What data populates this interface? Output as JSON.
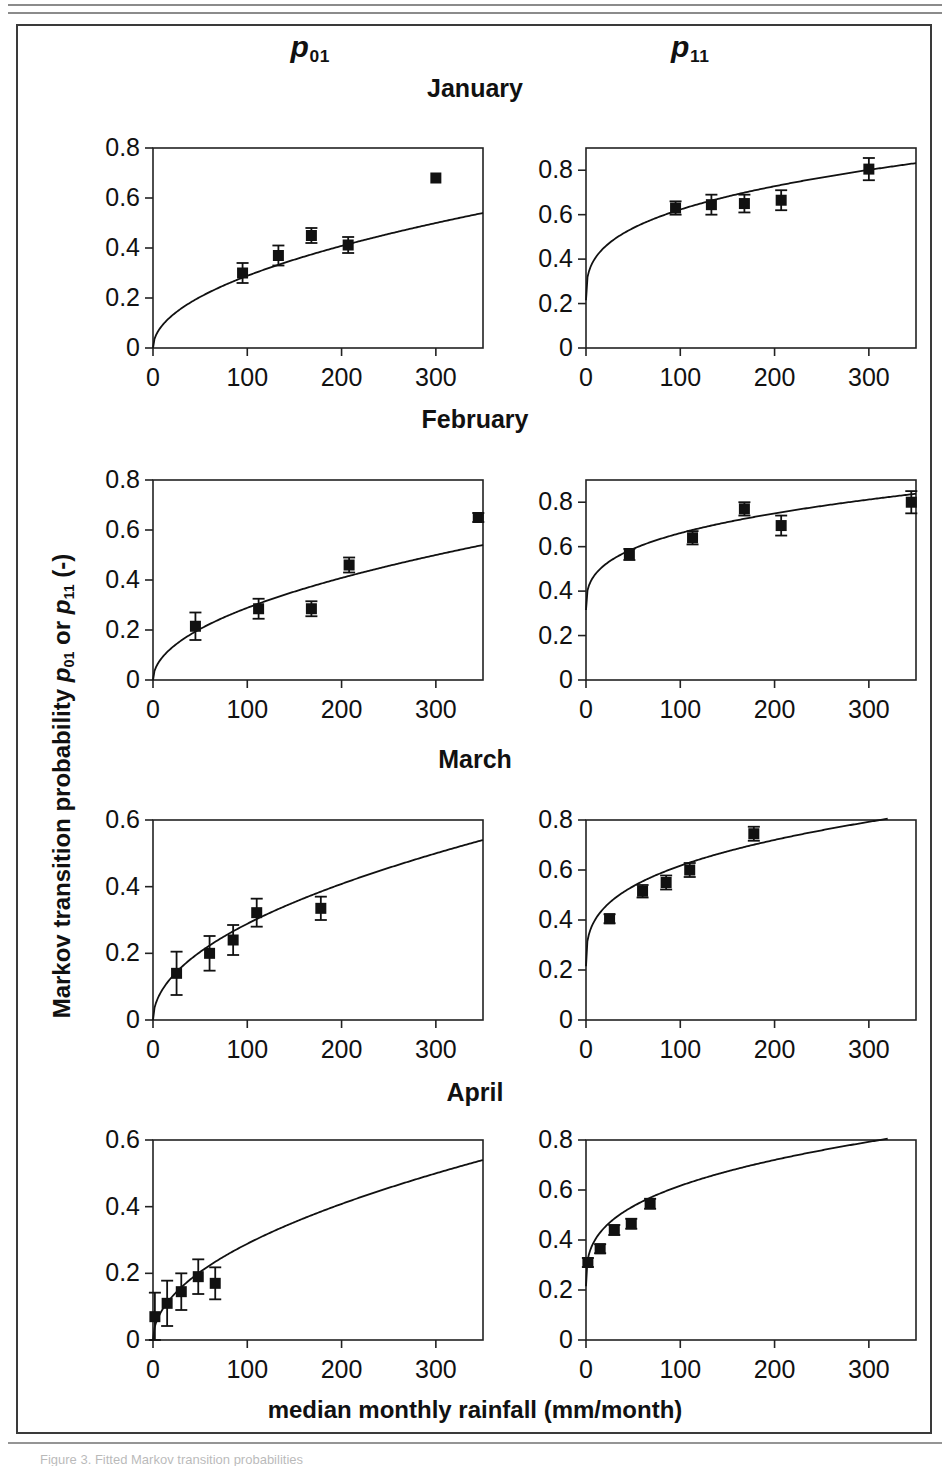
{
  "figure": {
    "column_headers": [
      {
        "name": "p01",
        "symbol": "p",
        "subscript": "01"
      },
      {
        "name": "p11",
        "symbol": "p",
        "subscript": "11"
      }
    ],
    "y_axis_title": {
      "prefix": "Markov transition probability ",
      "sym1": "p",
      "sub1": "01",
      "middle": " or ",
      "sym2": "p",
      "sub2": "11",
      "suffix": " (-)"
    },
    "x_axis_title": "median monthly rainfall (mm/month)",
    "month_titles": [
      "January",
      "February",
      "March",
      "April"
    ],
    "caption_partial": "Figure 3. Fitted Markov transition probabilities"
  },
  "chart_data": [
    {
      "id": "january-p01",
      "type": "scatter",
      "title": "January",
      "series_name": "p01",
      "xlabel": "median monthly rainfall (mm/month)",
      "ylabel": "Markov transition probability p01 or p11 (-)",
      "xlim": [
        0,
        350
      ],
      "ylim": [
        0,
        0.8
      ],
      "xticks": [
        0,
        100,
        200,
        300
      ],
      "yticks": [
        0,
        0.2,
        0.4,
        0.6,
        0.8
      ],
      "ytick_labels": [
        "0",
        "0.2",
        "0.4",
        "0.6",
        "0.8"
      ],
      "grid": false,
      "legend": "none",
      "points": [
        {
          "x": 95,
          "y": 0.3,
          "yerr": 0.04
        },
        {
          "x": 133,
          "y": 0.37,
          "yerr": 0.04
        },
        {
          "x": 168,
          "y": 0.45,
          "yerr": 0.03
        },
        {
          "x": 207,
          "y": 0.412,
          "yerr": 0.032
        },
        {
          "x": 300,
          "y": 0.68,
          "yerr": 0.0
        }
      ],
      "fit_curve": {
        "form": "a*x^b",
        "a": 0.0305,
        "b": 0.4938,
        "x_start": 0,
        "x_end": 350,
        "y_at_350": 0.54
      }
    },
    {
      "id": "january-p11",
      "type": "scatter",
      "title": "January",
      "series_name": "p11",
      "xlim": [
        0,
        350
      ],
      "ylim": [
        0,
        0.9
      ],
      "xticks": [
        0,
        100,
        200,
        300
      ],
      "yticks": [
        0,
        0.2,
        0.4,
        0.6,
        0.8
      ],
      "ytick_labels": [
        "0",
        "0.2",
        "0.4",
        "0.6",
        "0.8"
      ],
      "grid": false,
      "legend": "none",
      "points": [
        {
          "x": 95,
          "y": 0.63,
          "yerr": 0.03
        },
        {
          "x": 133,
          "y": 0.645,
          "yerr": 0.045
        },
        {
          "x": 168,
          "y": 0.65,
          "yerr": 0.04
        },
        {
          "x": 207,
          "y": 0.665,
          "yerr": 0.045
        },
        {
          "x": 300,
          "y": 0.805,
          "yerr": 0.05
        }
      ],
      "fit_curve": {
        "form": "a*x^b + c",
        "y_at_0": 0.215,
        "y_at_100": 0.635,
        "y_at_350": 0.832
      }
    },
    {
      "id": "february-p01",
      "type": "scatter",
      "title": "February",
      "series_name": "p01",
      "xlim": [
        0,
        350
      ],
      "ylim": [
        0,
        0.8
      ],
      "xticks": [
        0,
        100,
        200,
        300
      ],
      "yticks": [
        0,
        0.2,
        0.4,
        0.6,
        0.8
      ],
      "ytick_labels": [
        "0",
        "0.2",
        "0.4",
        "0.6",
        "0.8"
      ],
      "grid": false,
      "legend": "none",
      "points": [
        {
          "x": 45,
          "y": 0.215,
          "yerr": 0.055
        },
        {
          "x": 112,
          "y": 0.285,
          "yerr": 0.04
        },
        {
          "x": 168,
          "y": 0.285,
          "yerr": 0.03
        },
        {
          "x": 208,
          "y": 0.46,
          "yerr": 0.03
        },
        {
          "x": 345,
          "y": 0.65,
          "yerr": 0.018
        }
      ],
      "fit_curve": {
        "form": "a*x^b",
        "y_at_0": 0.0,
        "y_at_350": 0.54
      }
    },
    {
      "id": "february-p11",
      "type": "scatter",
      "title": "February",
      "series_name": "p11",
      "xlim": [
        0,
        350
      ],
      "ylim": [
        0,
        0.9
      ],
      "xticks": [
        0,
        100,
        200,
        300
      ],
      "yticks": [
        0,
        0.2,
        0.4,
        0.6,
        0.8
      ],
      "ytick_labels": [
        "0",
        "0.2",
        "0.4",
        "0.6",
        "0.8"
      ],
      "grid": false,
      "legend": "none",
      "points": [
        {
          "x": 46,
          "y": 0.565,
          "yerr": 0.025
        },
        {
          "x": 113,
          "y": 0.64,
          "yerr": 0.03
        },
        {
          "x": 168,
          "y": 0.77,
          "yerr": 0.03
        },
        {
          "x": 207,
          "y": 0.695,
          "yerr": 0.045
        },
        {
          "x": 345,
          "y": 0.8,
          "yerr": 0.05
        }
      ],
      "fit_curve": {
        "form": "a*x^b + c",
        "y_at_0": 0.315,
        "y_at_350": 0.838
      }
    },
    {
      "id": "march-p01",
      "type": "scatter",
      "title": "March",
      "series_name": "p01",
      "xlim": [
        0,
        350
      ],
      "ylim": [
        0,
        0.6
      ],
      "xticks": [
        0,
        100,
        200,
        300
      ],
      "yticks": [
        0,
        0.2,
        0.4,
        0.6
      ],
      "ytick_labels": [
        "0",
        "0.2",
        "0.4",
        "0.6"
      ],
      "grid": false,
      "legend": "none",
      "points": [
        {
          "x": 25,
          "y": 0.14,
          "yerr": 0.065
        },
        {
          "x": 60,
          "y": 0.2,
          "yerr": 0.052
        },
        {
          "x": 85,
          "y": 0.24,
          "yerr": 0.045
        },
        {
          "x": 110,
          "y": 0.322,
          "yerr": 0.042
        },
        {
          "x": 178,
          "y": 0.335,
          "yerr": 0.035
        }
      ],
      "fit_curve": {
        "form": "a*x^b",
        "y_at_0": 0.0,
        "y_at_350": 0.54
      }
    },
    {
      "id": "march-p11",
      "type": "scatter",
      "title": "March",
      "series_name": "p11",
      "xlim": [
        0,
        350
      ],
      "ylim": [
        0,
        0.8
      ],
      "xticks": [
        0,
        100,
        200,
        300
      ],
      "yticks": [
        0,
        0.2,
        0.4,
        0.6,
        0.8
      ],
      "ytick_labels": [
        "0",
        "0.2",
        "0.4",
        "0.6",
        "0.8"
      ],
      "grid": false,
      "legend": "none",
      "points": [
        {
          "x": 25,
          "y": 0.405,
          "yerr": 0.018
        },
        {
          "x": 60,
          "y": 0.515,
          "yerr": 0.025
        },
        {
          "x": 85,
          "y": 0.55,
          "yerr": 0.028
        },
        {
          "x": 110,
          "y": 0.6,
          "yerr": 0.028
        },
        {
          "x": 178,
          "y": 0.745,
          "yerr": 0.028
        }
      ],
      "fit_curve": {
        "form": "a*x^b + c",
        "y_at_0": 0.215,
        "y_at_320": 0.805
      }
    },
    {
      "id": "april-p01",
      "type": "scatter",
      "title": "April",
      "series_name": "p01",
      "xlim": [
        0,
        350
      ],
      "ylim": [
        0,
        0.6
      ],
      "xticks": [
        0,
        100,
        200,
        300
      ],
      "yticks": [
        0,
        0.2,
        0.4,
        0.6
      ],
      "ytick_labels": [
        "0",
        "0.2",
        "0.4",
        "0.6"
      ],
      "grid": false,
      "legend": "none",
      "points": [
        {
          "x": 2,
          "y": 0.07,
          "yerr": 0.072
        },
        {
          "x": 15,
          "y": 0.11,
          "yerr": 0.068
        },
        {
          "x": 30,
          "y": 0.145,
          "yerr": 0.055
        },
        {
          "x": 48,
          "y": 0.19,
          "yerr": 0.052
        },
        {
          "x": 66,
          "y": 0.17,
          "yerr": 0.048
        }
      ],
      "fit_curve": {
        "form": "a*x^b",
        "y_at_0": 0.0,
        "y_at_350": 0.54
      }
    },
    {
      "id": "april-p11",
      "type": "scatter",
      "title": "April",
      "series_name": "p11",
      "xlim": [
        0,
        350
      ],
      "ylim": [
        0,
        0.8
      ],
      "xticks": [
        0,
        100,
        200,
        300
      ],
      "yticks": [
        0,
        0.2,
        0.4,
        0.6,
        0.8
      ],
      "ytick_labels": [
        "0",
        "0.2",
        "0.4",
        "0.6",
        "0.8"
      ],
      "grid": false,
      "legend": "none",
      "points": [
        {
          "x": 2,
          "y": 0.31,
          "yerr": 0.018
        },
        {
          "x": 15,
          "y": 0.365,
          "yerr": 0.018
        },
        {
          "x": 30,
          "y": 0.44,
          "yerr": 0.02
        },
        {
          "x": 48,
          "y": 0.465,
          "yerr": 0.02
        },
        {
          "x": 68,
          "y": 0.545,
          "yerr": 0.02
        }
      ],
      "fit_curve": {
        "form": "a*x^b + c",
        "y_at_0": 0.215,
        "y_at_320": 0.805
      }
    }
  ],
  "xtick_labels": [
    "0",
    "100",
    "200",
    "300"
  ],
  "style": {
    "marker_color": "#111111",
    "line_color": "#111111",
    "axis_color": "#222222"
  }
}
